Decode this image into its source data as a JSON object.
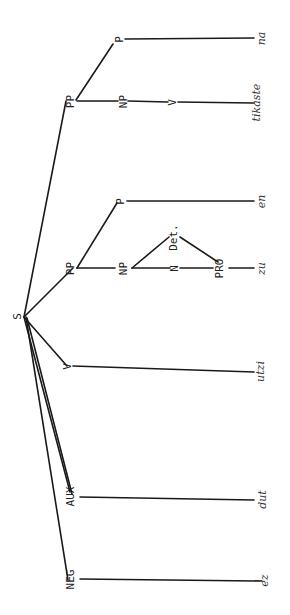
{
  "diagram": {
    "type": "syntax-tree",
    "orientation": "rotated-90",
    "root": "S",
    "nodes": {
      "S": "S",
      "pp1": "PP",
      "pp1_np": "NP",
      "pp1_v": "V",
      "pp1_p": "P",
      "pp2": "PP",
      "pp2_np": "NP",
      "pp2_n": "N",
      "pp2_det": "Det.",
      "pp2_pro": "PRO",
      "pp2_p": "P",
      "v": "V",
      "aux": "AUX",
      "neg": "NEG"
    },
    "leaves": {
      "na": "na",
      "tikaste": "tikaste",
      "en": "en",
      "zu": "zu",
      "utzi": "utzi",
      "dut": "dut",
      "ez": "ez"
    },
    "line_color": "#1a1a1a"
  }
}
